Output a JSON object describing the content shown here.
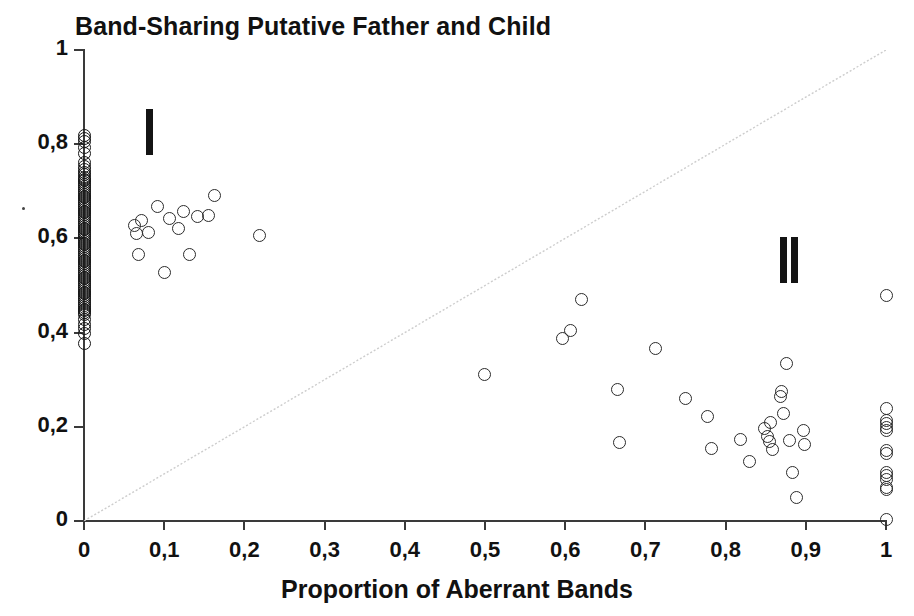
{
  "chart_data": {
    "type": "scatter",
    "title": "Band-Sharing Putative Father and Child",
    "xlabel": "Proportion of Aberrant Bands",
    "ylabel": "",
    "xlim": [
      0,
      1
    ],
    "ylim": [
      0,
      1
    ],
    "grid": false,
    "legend": "none",
    "x_ticks": [
      0,
      0.1,
      0.2,
      0.3,
      0.4,
      0.5,
      0.6,
      0.7,
      0.8,
      0.9,
      1
    ],
    "x_tick_labels": [
      "0",
      "0,1",
      "0,2",
      "0,3",
      "0,4",
      "0,5",
      "0,6",
      "0,7",
      "0,8",
      "0,9",
      "1"
    ],
    "y_ticks": [
      0,
      0.2,
      0.4,
      0.6,
      0.8,
      1
    ],
    "y_tick_labels": [
      "0",
      "0,2",
      "0,4",
      "0,6",
      "0,8",
      "1"
    ],
    "marker": "open-circle",
    "marker_color": "#2b2b2b",
    "reference_line": {
      "name": "identity-line",
      "from": [
        0,
        0
      ],
      "to": [
        1,
        1
      ],
      "style": "faint dotted gray",
      "color": "#c9c9c9"
    },
    "annotations": [
      {
        "label": "I",
        "x": 0.082,
        "y": 0.825,
        "note": "group I marker bar"
      },
      {
        "label": "II",
        "x": 0.878,
        "y": 0.555,
        "note": "group II marker bars"
      }
    ],
    "series": [
      {
        "name": "Group I - putative father / child pairs",
        "points": [
          [
            0.0,
            0.818
          ],
          [
            0.0,
            0.812
          ],
          [
            0.0,
            0.805
          ],
          [
            0.0,
            0.792
          ],
          [
            0.0,
            0.781
          ],
          [
            0.0,
            0.762
          ],
          [
            0.0,
            0.752
          ],
          [
            0.0,
            0.746
          ],
          [
            0.0,
            0.74
          ],
          [
            0.0,
            0.735
          ],
          [
            0.0,
            0.73
          ],
          [
            0.0,
            0.726
          ],
          [
            0.0,
            0.722
          ],
          [
            0.0,
            0.718
          ],
          [
            0.0,
            0.714
          ],
          [
            0.0,
            0.71
          ],
          [
            0.0,
            0.706
          ],
          [
            0.0,
            0.702
          ],
          [
            0.0,
            0.698
          ],
          [
            0.0,
            0.694
          ],
          [
            0.0,
            0.69
          ],
          [
            0.0,
            0.686
          ],
          [
            0.0,
            0.682
          ],
          [
            0.0,
            0.678
          ],
          [
            0.0,
            0.674
          ],
          [
            0.0,
            0.67
          ],
          [
            0.0,
            0.666
          ],
          [
            0.0,
            0.662
          ],
          [
            0.0,
            0.658
          ],
          [
            0.0,
            0.654
          ],
          [
            0.0,
            0.65
          ],
          [
            0.0,
            0.646
          ],
          [
            0.0,
            0.642
          ],
          [
            0.0,
            0.638
          ],
          [
            0.0,
            0.634
          ],
          [
            0.0,
            0.63
          ],
          [
            0.0,
            0.626
          ],
          [
            0.0,
            0.622
          ],
          [
            0.0,
            0.618
          ],
          [
            0.0,
            0.614
          ],
          [
            0.0,
            0.61
          ],
          [
            0.0,
            0.606
          ],
          [
            0.0,
            0.602
          ],
          [
            0.0,
            0.598
          ],
          [
            0.0,
            0.594
          ],
          [
            0.0,
            0.59
          ],
          [
            0.0,
            0.586
          ],
          [
            0.0,
            0.582
          ],
          [
            0.0,
            0.578
          ],
          [
            0.0,
            0.574
          ],
          [
            0.0,
            0.57
          ],
          [
            0.0,
            0.566
          ],
          [
            0.0,
            0.562
          ],
          [
            0.0,
            0.558
          ],
          [
            0.0,
            0.554
          ],
          [
            0.0,
            0.55
          ],
          [
            0.0,
            0.546
          ],
          [
            0.0,
            0.542
          ],
          [
            0.0,
            0.538
          ],
          [
            0.0,
            0.534
          ],
          [
            0.0,
            0.53
          ],
          [
            0.0,
            0.526
          ],
          [
            0.0,
            0.522
          ],
          [
            0.0,
            0.518
          ],
          [
            0.0,
            0.514
          ],
          [
            0.0,
            0.51
          ],
          [
            0.0,
            0.506
          ],
          [
            0.0,
            0.502
          ],
          [
            0.0,
            0.498
          ],
          [
            0.0,
            0.494
          ],
          [
            0.0,
            0.49
          ],
          [
            0.0,
            0.486
          ],
          [
            0.0,
            0.482
          ],
          [
            0.0,
            0.478
          ],
          [
            0.0,
            0.474
          ],
          [
            0.0,
            0.47
          ],
          [
            0.0,
            0.466
          ],
          [
            0.0,
            0.462
          ],
          [
            0.0,
            0.458
          ],
          [
            0.0,
            0.454
          ],
          [
            0.0,
            0.45
          ],
          [
            0.0,
            0.446
          ],
          [
            0.0,
            0.442
          ],
          [
            0.0,
            0.438
          ],
          [
            0.0,
            0.428
          ],
          [
            0.0,
            0.418
          ],
          [
            0.0,
            0.408
          ],
          [
            0.0,
            0.398
          ],
          [
            0.0,
            0.376
          ],
          [
            0.063,
            0.627
          ],
          [
            0.066,
            0.611
          ],
          [
            0.068,
            0.566
          ],
          [
            0.072,
            0.637
          ],
          [
            0.08,
            0.613
          ],
          [
            0.092,
            0.668
          ],
          [
            0.1,
            0.527
          ],
          [
            0.106,
            0.643
          ],
          [
            0.118,
            0.62
          ],
          [
            0.124,
            0.657
          ],
          [
            0.131,
            0.566
          ],
          [
            0.141,
            0.646
          ],
          [
            0.155,
            0.648
          ],
          [
            0.163,
            0.691
          ],
          [
            0.219,
            0.606
          ]
        ]
      },
      {
        "name": "Group II - excluded father / child pairs",
        "points": [
          [
            0.499,
            0.31
          ],
          [
            0.597,
            0.388
          ],
          [
            0.607,
            0.404
          ],
          [
            0.62,
            0.47
          ],
          [
            0.665,
            0.28
          ],
          [
            0.668,
            0.166
          ],
          [
            0.712,
            0.367
          ],
          [
            0.75,
            0.26
          ],
          [
            0.777,
            0.222
          ],
          [
            0.782,
            0.153
          ],
          [
            0.818,
            0.172
          ],
          [
            0.83,
            0.126
          ],
          [
            0.848,
            0.196
          ],
          [
            0.852,
            0.18
          ],
          [
            0.855,
            0.168
          ],
          [
            0.856,
            0.21
          ],
          [
            0.858,
            0.152
          ],
          [
            0.868,
            0.265
          ],
          [
            0.87,
            0.274
          ],
          [
            0.872,
            0.228
          ],
          [
            0.876,
            0.334
          ],
          [
            0.88,
            0.17
          ],
          [
            0.884,
            0.103
          ],
          [
            0.889,
            0.05
          ],
          [
            0.897,
            0.192
          ],
          [
            0.899,
            0.162
          ],
          [
            1.0,
            0.478
          ],
          [
            1.0,
            0.238
          ],
          [
            1.0,
            0.214
          ],
          [
            1.0,
            0.206
          ],
          [
            1.0,
            0.198
          ],
          [
            1.0,
            0.192
          ],
          [
            1.0,
            0.15
          ],
          [
            1.0,
            0.144
          ],
          [
            1.0,
            0.104
          ],
          [
            1.0,
            0.096
          ],
          [
            1.0,
            0.088
          ],
          [
            1.0,
            0.072
          ],
          [
            1.0,
            0.066
          ],
          [
            1.0,
            0.004
          ]
        ]
      }
    ]
  },
  "canvas": {
    "width": 914,
    "height": 616,
    "background": "#ffffff"
  }
}
